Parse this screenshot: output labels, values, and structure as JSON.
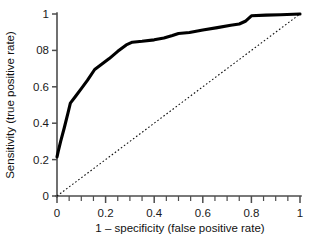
{
  "figure": {
    "background_color": "#ffffff",
    "curve_color": "#000000",
    "axis_color": "#4d4d4d",
    "reference_line_color": "#111111"
  },
  "axes": {
    "x_title": "1 – specificity (false positive rate)",
    "y_title": "Sensitivity (true positive rate)",
    "x_ticks": [
      "0",
      "0.2",
      "0.4",
      "0.6",
      "0.8",
      "1"
    ],
    "y_ticks": [
      "0",
      "0.2",
      "0.4",
      "0.6",
      "08",
      "1"
    ]
  },
  "chart_data": {
    "type": "line",
    "title": "",
    "subtitle": "",
    "xlabel": "1 – specificity (false positive rate)",
    "ylabel": "Sensitivity (true positive rate)",
    "xlim": [
      0,
      1
    ],
    "ylim": [
      0,
      1
    ],
    "xticks": [
      0,
      0.2,
      0.4,
      0.6,
      0.8,
      1
    ],
    "xtick_labels": [
      "0",
      "0.2",
      "0.4",
      "0.6",
      "0.8",
      "1"
    ],
    "xminor_tick_step": 0.05,
    "yticks": [
      0,
      0.2,
      0.4,
      0.6,
      0.8,
      1
    ],
    "ytick_labels": [
      "0",
      "0.2",
      "0.4",
      "0.6",
      "08",
      "1"
    ],
    "grid": false,
    "legend": "none",
    "series": [
      {
        "name": "ROC curve",
        "style": "solid",
        "color": "#000000",
        "linewidth": 3.1,
        "x": [
          0.0,
          0.005,
          0.015,
          0.03,
          0.045,
          0.055,
          0.075,
          0.1,
          0.125,
          0.155,
          0.185,
          0.215,
          0.25,
          0.285,
          0.31,
          0.35,
          0.4,
          0.44,
          0.475,
          0.5,
          0.545,
          0.6,
          0.66,
          0.715,
          0.75,
          0.775,
          0.8,
          0.86,
          0.92,
          1.0
        ],
        "y": [
          0.215,
          0.245,
          0.3,
          0.375,
          0.455,
          0.51,
          0.545,
          0.59,
          0.635,
          0.695,
          0.725,
          0.755,
          0.795,
          0.83,
          0.845,
          0.85,
          0.858,
          0.868,
          0.882,
          0.893,
          0.898,
          0.912,
          0.925,
          0.938,
          0.945,
          0.96,
          0.99,
          0.994,
          0.996,
          1.0
        ]
      },
      {
        "name": "Chance reference line",
        "style": "dotted",
        "color": "#111111",
        "linewidth": 1.1,
        "x": [
          0,
          1
        ],
        "y": [
          0,
          1
        ]
      }
    ]
  }
}
